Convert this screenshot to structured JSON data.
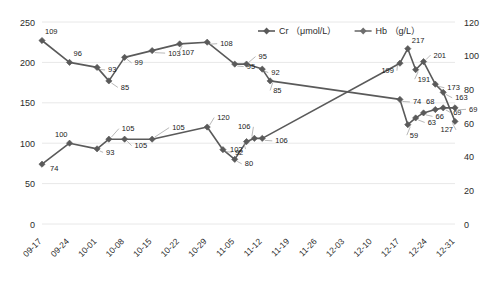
{
  "chart_data": {
    "type": "line",
    "title": "",
    "xlabel": "",
    "ylabel": "",
    "grid": true,
    "legend_position": "top-center",
    "categories": [
      "09-17",
      "09-24",
      "10-01",
      "10-08",
      "10-15",
      "10-22",
      "10-29",
      "11-05",
      "11-12",
      "11-19",
      "11-26",
      "12-03",
      "12-10",
      "12-17",
      "12-24",
      "12-31"
    ],
    "axes": {
      "left": {
        "label": "Cr (μmol/L)",
        "min": 0,
        "max": 250,
        "ticks": [
          0,
          50,
          100,
          150,
          200,
          250
        ]
      },
      "right": {
        "label": "Hb (g/L)",
        "min": 0,
        "max": 120,
        "ticks": [
          0,
          20,
          40,
          60,
          80,
          100,
          120
        ]
      }
    },
    "series": [
      {
        "name": "Cr （μmol/L）",
        "axis": "left",
        "color": "#5a5a5a",
        "points": [
          {
            "x": "09-17",
            "value": 74,
            "label": "74"
          },
          {
            "x": "09-24",
            "value": 100,
            "label": "100"
          },
          {
            "x": "10-01",
            "value": 93,
            "label": "93"
          },
          {
            "x": "10-04",
            "value": 105,
            "label": "105"
          },
          {
            "x": "10-08",
            "value": 105,
            "label": "105"
          },
          {
            "x": "10-15",
            "value": 105,
            "label": "105"
          },
          {
            "x": "10-29",
            "value": 120,
            "label": "120"
          },
          {
            "x": "11-02",
            "value": 92,
            "label": "92"
          },
          {
            "x": "11-05",
            "value": 80,
            "label": "80"
          },
          {
            "x": "11-08",
            "value": 102,
            "label": "102"
          },
          {
            "x": "11-10",
            "value": 106,
            "label": "106"
          },
          {
            "x": "11-12",
            "value": 106,
            "label": "106"
          },
          {
            "x": "12-17",
            "value": 199,
            "label": "199"
          },
          {
            "x": "12-19",
            "value": 217,
            "label": "217"
          },
          {
            "x": "12-21",
            "value": 191,
            "label": "191"
          },
          {
            "x": "12-23",
            "value": 201,
            "label": "201"
          },
          {
            "x": "12-26",
            "value": 173,
            "label": "173"
          },
          {
            "x": "12-28",
            "value": 163,
            "label": "163"
          },
          {
            "x": "12-31",
            "value": 127,
            "label": "127"
          }
        ]
      },
      {
        "name": "Hb （g/L）",
        "axis": "right",
        "color": "#6e6e6e",
        "points": [
          {
            "x": "09-17",
            "value": 109,
            "label": "109"
          },
          {
            "x": "09-24",
            "value": 96,
            "label": "96"
          },
          {
            "x": "10-01",
            "value": 93,
            "label": "93"
          },
          {
            "x": "10-04",
            "value": 85,
            "label": "85"
          },
          {
            "x": "10-08",
            "value": 99,
            "label": "99"
          },
          {
            "x": "10-15",
            "value": 103,
            "label": "103"
          },
          {
            "x": "10-22",
            "value": 107,
            "label": "107"
          },
          {
            "x": "10-29",
            "value": 108,
            "label": "108"
          },
          {
            "x": "11-05",
            "value": 95,
            "label": "95"
          },
          {
            "x": "11-08",
            "value": 95,
            "label": "95"
          },
          {
            "x": "11-12",
            "value": 92,
            "label": "92"
          },
          {
            "x": "11-14",
            "value": 85,
            "label": "85"
          },
          {
            "x": "12-17",
            "value": 74,
            "label": "74"
          },
          {
            "x": "12-19",
            "value": 59,
            "label": "59"
          },
          {
            "x": "12-21",
            "value": 63,
            "label": "63"
          },
          {
            "x": "12-23",
            "value": 66,
            "label": "66"
          },
          {
            "x": "12-26",
            "value": 68,
            "label": "68"
          },
          {
            "x": "12-28",
            "value": 69,
            "label": "69"
          },
          {
            "x": "12-31",
            "value": 69,
            "label": "69"
          }
        ]
      }
    ]
  },
  "legend": {
    "items": [
      {
        "label": "Cr （μmol/L）"
      },
      {
        "label": "Hb （g/L）"
      }
    ]
  },
  "left_axis_ticks": [
    "250",
    "200",
    "150",
    "100",
    "50",
    "0"
  ],
  "right_axis_ticks": [
    "120",
    "100",
    "80",
    "60",
    "40",
    "20",
    "0"
  ],
  "category_labels": [
    "09-17",
    "09-24",
    "10-01",
    "10-08",
    "10-15",
    "10-22",
    "10-29",
    "11-05",
    "11-12",
    "11-19",
    "11-26",
    "12-03",
    "12-10",
    "12-17",
    "12-24",
    "12-31"
  ]
}
